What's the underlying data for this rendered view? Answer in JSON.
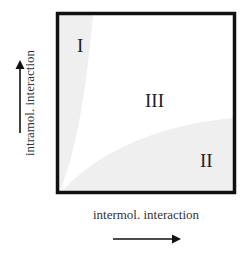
{
  "diagram": {
    "regions": [
      {
        "id": "I",
        "label": "I",
        "description": "shaded wedge along left edge (high intramolecular interaction)"
      },
      {
        "id": "II",
        "label": "II",
        "description": "shaded wedge along bottom edge (high intermolecular interaction)"
      },
      {
        "id": "III",
        "label": "III",
        "description": "unshaded central region"
      }
    ],
    "x_axis": {
      "label": "intermol. interaction",
      "arrow_direction": "right"
    },
    "y_axis": {
      "label": "intramol. interaction",
      "arrow_direction": "up"
    },
    "colors": {
      "frame": "#111111",
      "shaded_region": "#f0f0f0",
      "background": "#ffffff",
      "text": "#222222"
    }
  }
}
